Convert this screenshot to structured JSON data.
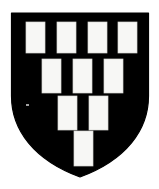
{
  "image": {
    "subject": "heraldic-shield",
    "description": "Coat of arms escutcheon, sable field charged with fifteen billets argent arranged in a descending pyramid",
    "width": 159,
    "height": 189,
    "background_color": "#ffffff"
  },
  "shield": {
    "name": "escutcheon",
    "field_color": "#000000",
    "outline_color": "#000000",
    "charge_color": "#f7f7f5",
    "geometry": {
      "left": 11.5,
      "right": 148.5,
      "top": 13.0,
      "point_y": 177.0,
      "shoulder_y": 96.0,
      "center_x": 80.0
    },
    "path": "M 11.5 13 L 148.5 13 L 148.5 96 C 148.5 130 126 160 80 177 C 34 160 11.5 130 11.5 96 Z"
  },
  "charges": {
    "name": "billets",
    "fill": "#f7f7f5",
    "stroke": "#d8d8d4",
    "count": 10,
    "rows": [
      {
        "row": 1,
        "count": 4,
        "y": 22,
        "height": 31,
        "width": 19,
        "xs": [
          26,
          57,
          88,
          118
        ]
      },
      {
        "row": 2,
        "count": 3,
        "y": 59,
        "height": 34,
        "width": 19,
        "xs": [
          42,
          73,
          104
        ]
      },
      {
        "row": 3,
        "count": 2,
        "y": 96,
        "height": 34,
        "width": 19,
        "xs": [
          58,
          89
        ]
      },
      {
        "row": 4,
        "count": 1,
        "y": 131,
        "height": 35,
        "width": 19,
        "xs": [
          74
        ]
      }
    ]
  },
  "artifacts": {
    "speck": {
      "name": "scan-speck",
      "x": 26,
      "y": 104,
      "width": 3,
      "height": 2,
      "color": "#bdbdbd"
    }
  }
}
